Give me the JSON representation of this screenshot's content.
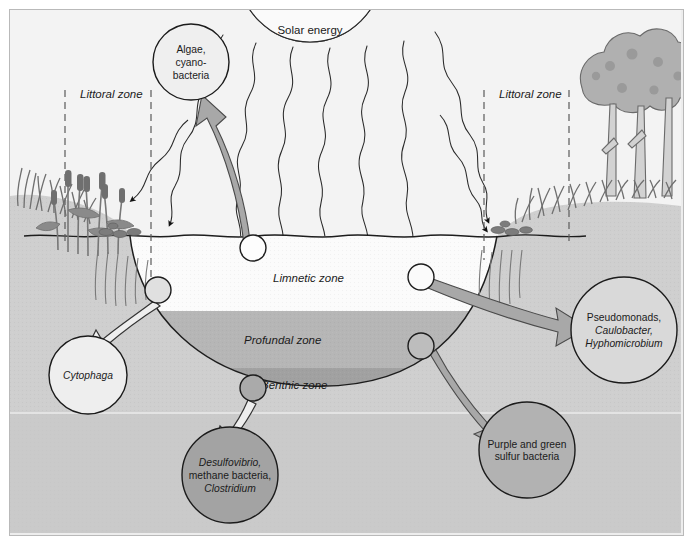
{
  "figure": {
    "background_color": "#ededed",
    "border_color": "#b9b9b9"
  },
  "sun": {
    "label": "Solar energy",
    "ray_count": 7
  },
  "zones": {
    "littoral_left": "Littoral zone",
    "littoral_right": "Littoral zone",
    "limnetic": "Limnetic zone",
    "profundal": "Profundal zone",
    "benthic": "Benthic zone"
  },
  "colors": {
    "sky": "#f2f2f2",
    "water_limnetic": "#fbfbfb",
    "water_profundal": "#b6b6b6",
    "water_benthic": "#a0a0a0",
    "land": "#cfcfcf",
    "sediment": "#c8c8c8",
    "vegetation": "#9a9a9a",
    "arrow_gray": "#a8a8a8",
    "bubble_light": "#ededed",
    "bubble_dark": "#9e9e9e",
    "bubble_mid": "#b0b0b0",
    "outline": "#1b1b1b"
  },
  "bubbles": [
    {
      "id": "algae",
      "name": "algae-cyanobacteria-bubble",
      "lines": [
        "Algae,",
        "cyano-",
        "bacteria"
      ],
      "italic": [
        false,
        false,
        false
      ],
      "fill": "#efefef",
      "cx": 181,
      "cy": 52,
      "r": 38
    },
    {
      "id": "cytophaga",
      "name": "cytophaga-bubble",
      "lines": [
        "Cytophaga"
      ],
      "italic": [
        true
      ],
      "fill": "#eeeeee",
      "cx": 78,
      "cy": 365,
      "r": 39
    },
    {
      "id": "pseudomonads",
      "name": "pseudomonads-bubble",
      "lines": [
        "Pseudomonads,",
        "Caulobacter,",
        "Hyphomicrobium"
      ],
      "italic": [
        false,
        true,
        true
      ],
      "fill": "#d9d9d9",
      "cx": 614,
      "cy": 320,
      "r": 53
    },
    {
      "id": "desulfovibrio",
      "name": "desulfovibrio-methane-clostridium-bubble",
      "lines": [
        "Desulfovibrio,",
        "methane bacteria,",
        "Clostridium"
      ],
      "italic": [
        true,
        false,
        true
      ],
      "fill": "#a3a3a3",
      "cx": 220,
      "cy": 465,
      "r": 48
    },
    {
      "id": "sulfur",
      "name": "purple-green-sulfur-bacteria-bubble",
      "lines": [
        "Purple and green",
        "sulfur bacteria"
      ],
      "italic": [
        false,
        false
      ],
      "fill": "#b2b2b2",
      "cx": 517,
      "cy": 440,
      "r": 48
    }
  ],
  "source_nodes": [
    {
      "name": "source-node-surface-algae",
      "cx": 243,
      "cy": 238,
      "r": 13
    },
    {
      "name": "source-node-littoral-shore",
      "cx": 148,
      "cy": 280,
      "r": 13
    },
    {
      "name": "source-node-benthic-sediment",
      "cx": 243,
      "cy": 378,
      "r": 13
    },
    {
      "name": "source-node-limnetic-right",
      "cx": 411,
      "cy": 267,
      "r": 13
    },
    {
      "name": "source-node-profundal-right",
      "cx": 411,
      "cy": 336,
      "r": 13
    }
  ]
}
